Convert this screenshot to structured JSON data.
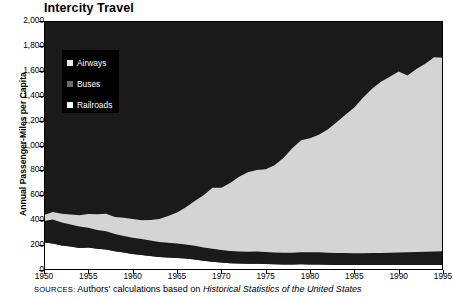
{
  "chart_data": {
    "type": "area",
    "stacked": true,
    "title": "Intercity Travel",
    "xlabel": "",
    "ylabel": "Annual Passenger-Miles per Capita",
    "xlim": [
      1950,
      1995
    ],
    "ylim": [
      0,
      2000
    ],
    "ytick_step": 200,
    "xtick_step": 5,
    "grid": false,
    "legend_position": "upper left inside plot",
    "xtick_labels": [
      "1950",
      "1955",
      "1960",
      "1965",
      "1970",
      "1975",
      "1980",
      "1985",
      "1990",
      "1995"
    ],
    "ytick_labels": [
      "0",
      "200",
      "400",
      "600",
      "800",
      "1,000",
      "1,200",
      "1,400",
      "1,600",
      "1,800",
      "2,000"
    ],
    "x": [
      1950,
      1951,
      1952,
      1953,
      1954,
      1955,
      1956,
      1957,
      1958,
      1959,
      1960,
      1961,
      1962,
      1963,
      1964,
      1965,
      1966,
      1967,
      1968,
      1969,
      1970,
      1971,
      1972,
      1973,
      1974,
      1975,
      1976,
      1977,
      1978,
      1979,
      1980,
      1981,
      1982,
      1983,
      1984,
      1985,
      1986,
      1987,
      1988,
      1989,
      1990,
      1991,
      1992,
      1993,
      1994,
      1995
    ],
    "series": [
      {
        "name": "Railroads",
        "color": "#ffffff",
        "order": 1,
        "values": [
          220,
          213,
          196,
          188,
          176,
          180,
          170,
          165,
          150,
          140,
          128,
          120,
          112,
          105,
          100,
          96,
          92,
          84,
          74,
          66,
          60,
          55,
          52,
          50,
          50,
          48,
          46,
          45,
          44,
          46,
          45,
          44,
          42,
          41,
          41,
          40,
          40,
          40,
          40,
          40,
          40,
          40,
          40,
          40,
          40,
          40
        ]
      },
      {
        "name": "Buses",
        "color": "#1a1a1a",
        "order": 2,
        "values": [
          173,
          193,
          186,
          178,
          174,
          160,
          152,
          146,
          140,
          134,
          132,
          130,
          124,
          120,
          118,
          116,
          113,
          110,
          106,
          104,
          100,
          98,
          97,
          96,
          98,
          96,
          95,
          94,
          94,
          96,
          98,
          98,
          96,
          95,
          95,
          95,
          95,
          96,
          97,
          98,
          100,
          102,
          104,
          106,
          108,
          110
        ]
      },
      {
        "name": "Airways",
        "color": "#d4d4d4",
        "order": 3,
        "values": [
          48,
          60,
          70,
          80,
          90,
          110,
          125,
          140,
          135,
          145,
          150,
          150,
          165,
          185,
          215,
          250,
          300,
          360,
          420,
          490,
          500,
          545,
          600,
          640,
          655,
          665,
          700,
          760,
          840,
          900,
          915,
          945,
          990,
          1050,
          1110,
          1170,
          1250,
          1320,
          1375,
          1415,
          1455,
          1420,
          1470,
          1510,
          1560,
          1555
        ]
      }
    ],
    "totals_note": {
      "1950": 441,
      "1970": 660,
      "1995": 1705
    }
  },
  "legend": {
    "items": [
      {
        "label": "Airways",
        "swatch": "#e8e8e8"
      },
      {
        "label": "Buses",
        "swatch": "#6b6b6b"
      },
      {
        "label": "Railroads",
        "swatch": "#ffffff"
      }
    ]
  },
  "source": {
    "label": "SOURCES:",
    "text_before": " Authors' calculations based on ",
    "italic_title": "Historical Statistics of the United States"
  }
}
